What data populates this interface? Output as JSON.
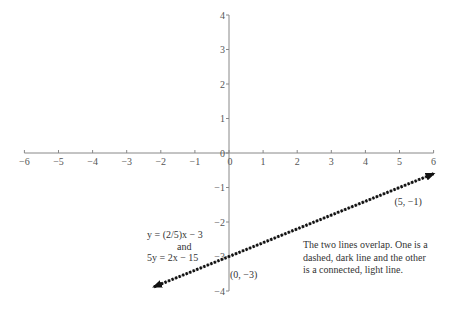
{
  "chart_data": {
    "type": "line",
    "title": "",
    "xlabel": "",
    "ylabel": "",
    "xlim": [
      -6,
      6
    ],
    "ylim": [
      -4,
      4
    ],
    "grid": false,
    "x_ticks": [
      -6,
      -5,
      -4,
      -3,
      -2,
      -1,
      0,
      1,
      2,
      3,
      4,
      5,
      6
    ],
    "x_tick_labels": [
      "−6",
      "−5",
      "−4",
      "−3",
      "−2",
      "−1",
      "0",
      "1",
      "2",
      "3",
      "4",
      "5",
      "6"
    ],
    "y_ticks": [
      4,
      3,
      2,
      1,
      0,
      -1,
      -2,
      -3,
      -4
    ],
    "y_tick_labels": [
      "4",
      "3",
      "2",
      "1",
      "0",
      "−1",
      "−2",
      "−3",
      "−4"
    ],
    "series": [
      {
        "name": "y = (2/5)x − 3",
        "style": "connected, light line",
        "color": "#aaaaaa",
        "x": [
          -2.2,
          6
        ],
        "y": [
          -3.88,
          -0.6
        ]
      },
      {
        "name": "5y = 2x − 15",
        "style": "dashed, dark line",
        "color": "#111111",
        "x": [
          -2.2,
          6
        ],
        "y": [
          -3.88,
          -0.6
        ]
      }
    ],
    "points": [
      {
        "label": "(0, −3)",
        "x": 0,
        "y": -3
      },
      {
        "label": "(5, −1)",
        "x": 5,
        "y": -1
      }
    ],
    "annotations": {
      "equation_label": [
        "y = (2/5)x − 3",
        "and",
        "5y = 2x − 15"
      ],
      "note": [
        "The two lines overlap. One is a",
        "dashed, dark line and the other",
        "is a connected, light line."
      ]
    }
  }
}
